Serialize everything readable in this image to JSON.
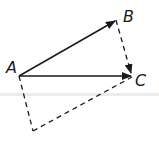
{
  "diagram": {
    "type": "vector-parallelogram",
    "points": {
      "A": {
        "label": "A",
        "x": 19,
        "y": 76
      },
      "B": {
        "label": "B",
        "x": 116,
        "y": 20
      },
      "C": {
        "label": "C",
        "x": 132,
        "y": 76
      },
      "D": {
        "label": "",
        "x": 33,
        "y": 131
      }
    },
    "labels": {
      "A": "A",
      "B": "B",
      "C": "C"
    },
    "vectors": [
      {
        "from": "A",
        "to": "B",
        "style": "solid",
        "arrow": true
      },
      {
        "from": "A",
        "to": "C",
        "style": "solid",
        "arrow": true
      },
      {
        "from": "B",
        "to": "C",
        "style": "dashed",
        "arrow": true
      }
    ],
    "dashed_segments": [
      {
        "from": "A",
        "to": "D"
      },
      {
        "from": "D",
        "to": "C"
      }
    ],
    "colors": {
      "stroke": "#1a1a1a",
      "background": "#ffffff",
      "band": "#ececec"
    }
  }
}
